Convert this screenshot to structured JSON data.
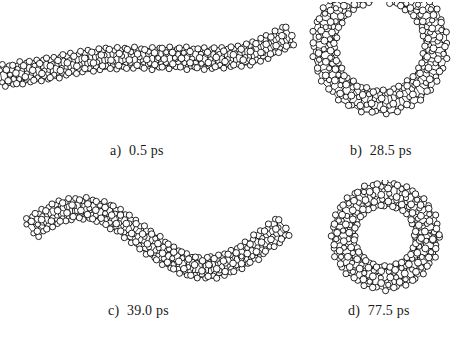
{
  "figure": {
    "kind": "molecular-dynamics-snapshots",
    "background_color": "#ffffff",
    "atom_fill_color": "#ffffff",
    "atom_stroke_color": "#000000",
    "bond_color": "#000000",
    "caption_color": "#1a1a1a",
    "panel_count": 4,
    "grid": "2x2"
  },
  "panels": [
    {
      "id": "a",
      "label": "a)",
      "time": "0.5 ps",
      "time_value": 0.5,
      "time_unit": "ps",
      "shape": "extended-straight-chain",
      "description": "nearly linear extended nanotube lying horizontally"
    },
    {
      "id": "b",
      "label": "b)",
      "time": "28.5 ps",
      "time_value": 28.5,
      "time_unit": "ps",
      "shape": "u-shaped-horseshoe",
      "description": "chain bent into an open U / horseshoe arc"
    },
    {
      "id": "c",
      "label": "c)",
      "time": "39.0 ps",
      "time_value": 39.0,
      "time_unit": "ps",
      "shape": "sinusoidal-wave",
      "description": "chain buckled into an S-shaped sinusoid"
    },
    {
      "id": "d",
      "label": "d)",
      "time": "77.5 ps",
      "time_value": 77.5,
      "time_unit": "ps",
      "shape": "closed-ring-torus",
      "description": "chain closed into a ring / torus"
    }
  ],
  "chart_data": {
    "type": "scatter",
    "title": "",
    "xlabel": "",
    "ylabel": "",
    "subplots": [
      {
        "id": "a",
        "caption": "a)  0.5 ps",
        "geometry": "line",
        "axis_points": [
          [
            4,
            62
          ],
          [
            26,
            58
          ],
          [
            52,
            54
          ],
          [
            80,
            48
          ],
          [
            108,
            44
          ],
          [
            136,
            44
          ],
          [
            164,
            44
          ],
          [
            192,
            44
          ],
          [
            220,
            44
          ],
          [
            244,
            42
          ],
          [
            266,
            34
          ],
          [
            288,
            22
          ]
        ],
        "tube_radius": 11,
        "rings": 34,
        "atoms_per_ring": 6
      },
      {
        "id": "b",
        "caption": "b)  28.5 ps",
        "geometry": "arc",
        "arc_center": [
          80,
          44
        ],
        "arc_radius": 56,
        "arc_start_deg": -76,
        "arc_end_deg": 256,
        "arc_open_gap_deg": 152,
        "tube_radius": 12,
        "rings": 32,
        "atoms_per_ring": 6
      },
      {
        "id": "c",
        "caption": "c)  39.0 ps",
        "geometry": "sine",
        "sine_x_start": 22,
        "sine_x_end": 272,
        "sine_amplitude": 30,
        "sine_baseline": 56,
        "sine_periods": 1.0,
        "sine_phase_deg": 200,
        "tube_radius": 11,
        "rings": 34,
        "atoms_per_ring": 6
      },
      {
        "id": "d",
        "caption": "d)  77.5 ps",
        "geometry": "circle",
        "circle_center": [
          70,
          56
        ],
        "circle_radius": 42,
        "tube_radius": 12,
        "rings": 32,
        "atoms_per_ring": 6
      }
    ]
  }
}
